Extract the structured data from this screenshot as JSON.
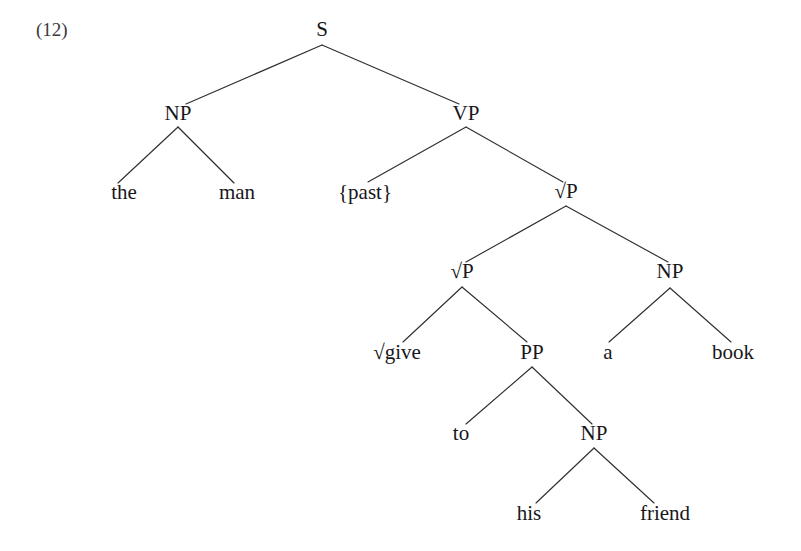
{
  "figure": {
    "example_number": "(12)",
    "type": "syntax-tree",
    "sentence": "the man {past} give to his friend a book",
    "background_color": "#ffffff",
    "line_color": "#2f2f33",
    "text_color": "#17171a"
  },
  "nodes": {
    "s": {
      "label": "S",
      "x": 322,
      "y": 36,
      "kind": "category"
    },
    "np_subj": {
      "label": "NP",
      "x": 178,
      "y": 120,
      "kind": "category"
    },
    "vp": {
      "label": "VP",
      "x": 466,
      "y": 120,
      "kind": "category"
    },
    "the": {
      "label": "the",
      "x": 124,
      "y": 199,
      "kind": "terminal"
    },
    "man": {
      "label": "man",
      "x": 237,
      "y": 199,
      "kind": "terminal"
    },
    "past": {
      "label": "{past}",
      "x": 365,
      "y": 199,
      "kind": "terminal"
    },
    "rootp1": {
      "label": "√P",
      "x": 566,
      "y": 198,
      "kind": "category"
    },
    "rootp2": {
      "label": "√P",
      "x": 462,
      "y": 278,
      "kind": "category"
    },
    "np_obj": {
      "label": "NP",
      "x": 670,
      "y": 278,
      "kind": "category"
    },
    "give": {
      "label": "√give",
      "x": 397,
      "y": 359,
      "kind": "terminal"
    },
    "pp": {
      "label": "PP",
      "x": 532,
      "y": 359,
      "kind": "category"
    },
    "a": {
      "label": "a",
      "x": 608,
      "y": 359,
      "kind": "terminal"
    },
    "book": {
      "label": "book",
      "x": 733,
      "y": 359,
      "kind": "terminal"
    },
    "to": {
      "label": "to",
      "x": 461,
      "y": 440,
      "kind": "terminal"
    },
    "np_goal": {
      "label": "NP",
      "x": 594,
      "y": 440,
      "kind": "category"
    },
    "his": {
      "label": "his",
      "x": 529,
      "y": 520,
      "kind": "terminal"
    },
    "friend": {
      "label": "friend",
      "x": 665,
      "y": 520,
      "kind": "terminal"
    }
  },
  "edges": [
    {
      "from": "s",
      "to": "np_subj",
      "x1": 322,
      "y1": 45,
      "x2": 186,
      "y2": 104
    },
    {
      "from": "s",
      "to": "vp",
      "x1": 322,
      "y1": 45,
      "x2": 459,
      "y2": 104
    },
    {
      "from": "np_subj",
      "to": "the",
      "x1": 178,
      "y1": 127,
      "x2": 118,
      "y2": 183
    },
    {
      "from": "np_subj",
      "to": "man",
      "x1": 178,
      "y1": 127,
      "x2": 234,
      "y2": 183
    },
    {
      "from": "vp",
      "to": "past",
      "x1": 466,
      "y1": 127,
      "x2": 368,
      "y2": 182
    },
    {
      "from": "vp",
      "to": "rootp1",
      "x1": 466,
      "y1": 127,
      "x2": 563,
      "y2": 182
    },
    {
      "from": "rootp1",
      "to": "rootp2",
      "x1": 566,
      "y1": 206,
      "x2": 466,
      "y2": 262
    },
    {
      "from": "rootp1",
      "to": "np_obj",
      "x1": 566,
      "y1": 206,
      "x2": 668,
      "y2": 262
    },
    {
      "from": "rootp2",
      "to": "give",
      "x1": 462,
      "y1": 287,
      "x2": 403,
      "y2": 342
    },
    {
      "from": "rootp2",
      "to": "pp",
      "x1": 462,
      "y1": 287,
      "x2": 527,
      "y2": 342
    },
    {
      "from": "np_obj",
      "to": "a",
      "x1": 670,
      "y1": 288,
      "x2": 609,
      "y2": 342
    },
    {
      "from": "np_obj",
      "to": "book",
      "x1": 670,
      "y1": 288,
      "x2": 731,
      "y2": 342
    },
    {
      "from": "pp",
      "to": "to",
      "x1": 532,
      "y1": 367,
      "x2": 466,
      "y2": 424
    },
    {
      "from": "pp",
      "to": "np_goal",
      "x1": 532,
      "y1": 367,
      "x2": 592,
      "y2": 424
    },
    {
      "from": "np_goal",
      "to": "his",
      "x1": 594,
      "y1": 448,
      "x2": 536,
      "y2": 503
    },
    {
      "from": "np_goal",
      "to": "friend",
      "x1": 594,
      "y1": 448,
      "x2": 654,
      "y2": 503
    }
  ],
  "example_label": {
    "text": "(12)",
    "x": 36,
    "y": 36
  }
}
